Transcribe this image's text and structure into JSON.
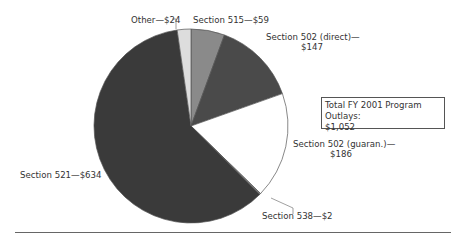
{
  "chart_data": {
    "type": "pie",
    "title": "",
    "units": "$ millions",
    "categories": [
      "Section 515",
      "Section 502 (direct)",
      "Section 502 (guaran.)",
      "Section 538",
      "Section 521",
      "Other"
    ],
    "values": [
      59,
      147,
      186,
      2,
      634,
      24
    ],
    "colors": [
      "#8a8a8a",
      "#4a4a4a",
      "#ffffff",
      "#9a9a9a",
      "#3a3a3a",
      "#dddddd"
    ],
    "total": 1052,
    "start_angle_deg": 0,
    "direction": "clockwise",
    "legend": "none",
    "annotation": "Total FY 2001 Program Outlays: $1,052"
  },
  "labels": {
    "other": "Other—$24",
    "s515": "Section 515—$59",
    "s502d_line1": "Section 502 (direct)—",
    "s502d_line2": "$147",
    "s502g_line1": "Section 502 (guaran.)—",
    "s502g_line2": "$186",
    "s538": "Section 538—$2",
    "s521": "Section 521—$634"
  },
  "total_box": {
    "line1": "Total FY 2001 Program Outlays:",
    "line2": "$1,052"
  }
}
